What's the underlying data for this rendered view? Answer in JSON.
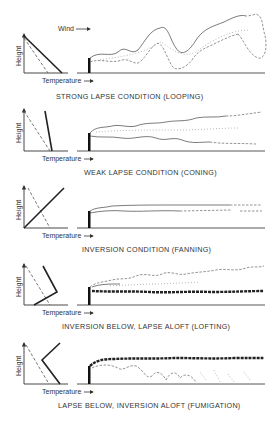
{
  "diagram": {
    "wind_label": "Wind",
    "panels": [
      {
        "id": "looping",
        "height_label": "Height",
        "temperature_label": "Temperature",
        "caption": "STRONG LAPSE CONDITION (LOOPING)"
      },
      {
        "id": "coning",
        "height_label": "Height",
        "temperature_label": "Temperature",
        "caption": "WEAK LAPSE CONDITION (CONING)"
      },
      {
        "id": "fanning",
        "height_label": "Height",
        "temperature_label": "Temperature",
        "caption": "INVERSION CONDITION (FANNING)"
      },
      {
        "id": "lofting",
        "height_label": "Height",
        "temperature_label": "Temperature",
        "caption": "INVERSION BELOW, LAPSE ALOFT (LOFTING)"
      },
      {
        "id": "fumigation",
        "height_label": "Height",
        "temperature_label": "Temperature",
        "caption": "LAPSE BELOW, INVERSION ALOFT (FUMIGATION)"
      }
    ]
  }
}
